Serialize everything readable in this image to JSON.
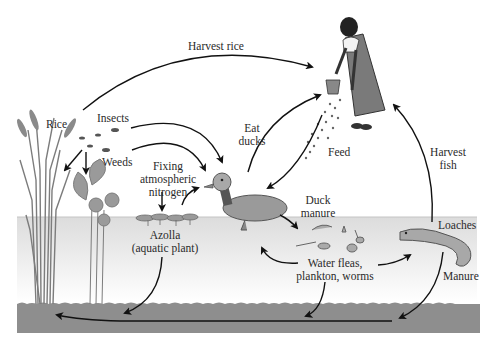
{
  "diagram": {
    "colors": {
      "water": "#e6e6e6",
      "water_surface": "#c8c8c8",
      "soil": "#8e8e8e",
      "arrow": "#111111",
      "plant": "#8a8a8a",
      "duck": "#9a9a9a",
      "loach": "#a8a8a8",
      "person_dress": "#7a7a7a"
    },
    "labels": {
      "harvest_rice": "Harvest rice",
      "rice": "Rice",
      "insects": "Insects",
      "weeds": "Weeds",
      "fixing_line1": "Fixing",
      "fixing_line2": "atmospheric",
      "fixing_line3": "nitrogen",
      "azolla_line1": "Azolla",
      "azolla_line2": "(aquatic plant)",
      "eat_ducks_line1": "Eat",
      "eat_ducks_line2": "ducks",
      "feed": "Feed",
      "harvest_fish_line1": "Harvest",
      "harvest_fish_line2": "fish",
      "duck_manure_line1": "Duck",
      "duck_manure_line2": "manure",
      "water_fleas_line1": "Water fleas,",
      "water_fleas_line2": "plankton, worms",
      "loaches": "Loaches",
      "manure": "Manure"
    }
  }
}
